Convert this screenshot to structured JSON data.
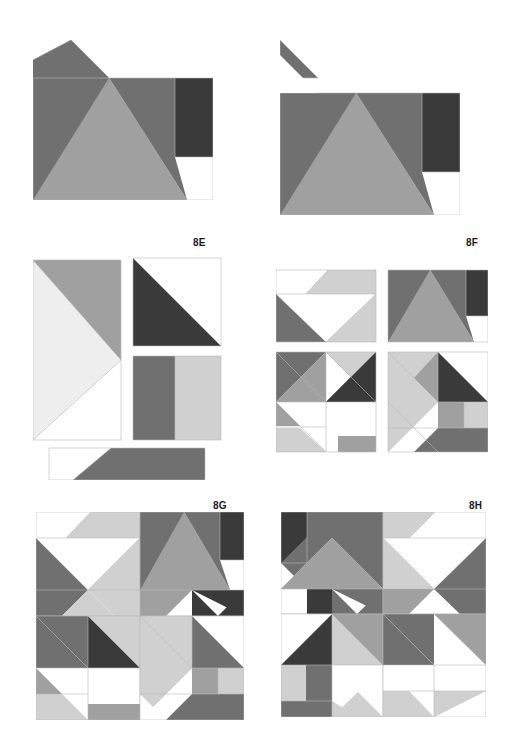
{
  "page": {
    "background": "#ffffff",
    "width": 509,
    "height": 755
  },
  "palette": {
    "white": "#ffffff",
    "very_light_gray": "#eeeeee",
    "light_gray": "#d0d0d0",
    "mid_gray": "#a0a0a0",
    "dark_gray": "#707070",
    "darker_gray": "#5a5a5a",
    "near_black": "#3a3a3a",
    "outline": "#b9b9b9",
    "label_color": "#1a1a1a"
  },
  "figures": [
    {
      "id": "8C",
      "label": "8C",
      "label_x": 196,
      "label_y": 59,
      "x": 33,
      "y": 40,
      "width": 180,
      "height": 160,
      "description": "Single pieced unit: large dark-gray triangles, near-black rectangle at upper right, mid-gray triangle at lower centre, white triangle at lower right."
    },
    {
      "id": "8D",
      "label": "8D",
      "label_x": 432,
      "label_y": 66,
      "x": 280,
      "y": 40,
      "width": 180,
      "height": 175,
      "description": "Same unit as 8C with an extra small dark-gray half-square triangle floating above the left edge."
    },
    {
      "id": "8E",
      "label": "8E",
      "label_x": 193,
      "label_y": 237,
      "x": 33,
      "y": 250,
      "width": 190,
      "height": 230,
      "description": "Exploded view: tall light-gray rectangle with dark triangle, near-black half-square triangle, two-bar rectangle, and a bottom strip with dark parallelogram."
    },
    {
      "id": "8F",
      "label": "8F",
      "label_x": 466,
      "label_y": 237,
      "x": 276,
      "y": 250,
      "width": 212,
      "height": 205,
      "description": "Four quadrant units arranged two by two showing flying-geese and half-square triangle sub-blocks."
    },
    {
      "id": "8G",
      "label": "8G",
      "label_x": 213,
      "label_y": 500,
      "x": 36,
      "y": 512,
      "width": 208,
      "height": 208,
      "description": "Complete pinwheel quilt block assembled from four quadrant units."
    },
    {
      "id": "8H",
      "label": "8H",
      "label_x": 469,
      "label_y": 500,
      "x": 281,
      "y": 512,
      "width": 205,
      "height": 205,
      "description": "Alternate colourway of the complete quilt block with rotated quadrant units."
    }
  ]
}
